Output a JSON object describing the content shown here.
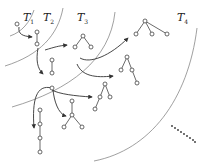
{
  "diagram": {
    "type": "tree-growth-regions",
    "colors": {
      "boundary": "#777777",
      "arrow": "#333333",
      "node_stroke": "#444444",
      "edge": "#444444",
      "dots": "#333333"
    },
    "regions": [
      {
        "label": "T",
        "sub": "1"
      },
      {
        "label": "T",
        "sub": "2"
      },
      {
        "label": "T",
        "sub": "3"
      },
      {
        "label": "T",
        "sub": "4"
      }
    ],
    "continuation": "dotted-line"
  }
}
